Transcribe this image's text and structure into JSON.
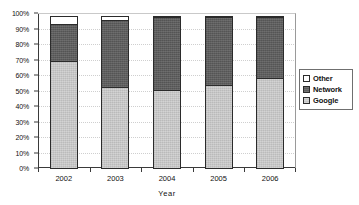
{
  "chart_data": {
    "type": "bar",
    "subtype": "100% stacked column",
    "title": "",
    "xlabel": "Year",
    "ylabel": "",
    "categories": [
      "2002",
      "2003",
      "2004",
      "2005",
      "2006"
    ],
    "series": [
      {
        "name": "Google",
        "values": [
          70,
          53,
          51,
          54,
          59
        ]
      },
      {
        "name": "Network",
        "values": [
          24,
          44,
          48,
          45,
          40
        ]
      },
      {
        "name": "Other",
        "values": [
          6,
          3,
          1,
          1,
          1
        ]
      }
    ],
    "stack_order_bottom_to_top": [
      "Google",
      "Network",
      "Other"
    ],
    "ylim": [
      0,
      100
    ],
    "y_ticks": [
      "0%",
      "10%",
      "20%",
      "30%",
      "40%",
      "50%",
      "60%",
      "70%",
      "80%",
      "90%",
      "100%"
    ],
    "y_tick_values": [
      0,
      10,
      20,
      30,
      40,
      50,
      60,
      70,
      80,
      90,
      100
    ],
    "grid": true,
    "legend_position": "right",
    "legend_entries": [
      "Other",
      "Network",
      "Google"
    ],
    "colors": {
      "google": "#c6c6c6",
      "network": "#5e5e5e",
      "other": "#ffffff",
      "axis": "#3a3a3a",
      "grid": "#cfcfcf",
      "text": "#111111",
      "background": "#ffffff"
    }
  }
}
